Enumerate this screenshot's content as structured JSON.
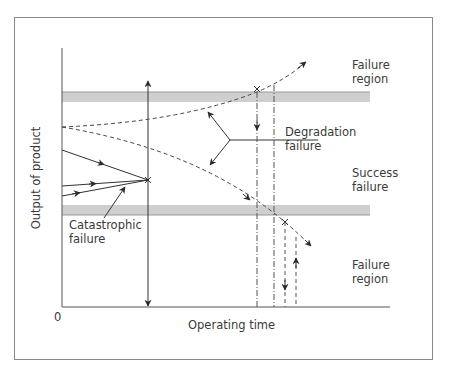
{
  "diagram": {
    "axes": {
      "y_label": "Output of product",
      "x_label": "Operating time",
      "origin_label": "0"
    },
    "regions": {
      "upper": [
        "Failure",
        "region"
      ],
      "middle": [
        "Success",
        "failure"
      ],
      "lower": [
        "Failure",
        "region"
      ]
    },
    "annotations": {
      "degradation": [
        "Degradation",
        "failure"
      ],
      "catastrophic": [
        "Catastrophic",
        "failure"
      ]
    },
    "colors": {
      "line": "#3a3a3a",
      "band": "#cfcfcf",
      "frame": "#8a8a8a"
    }
  }
}
